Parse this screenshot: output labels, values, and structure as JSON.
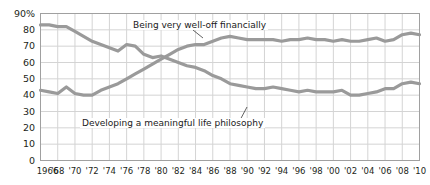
{
  "chart_data": {
    "type": "line",
    "title": "",
    "xlabel": "",
    "ylabel": "",
    "xlim": [
      1966,
      2010
    ],
    "ylim": [
      0,
      90
    ],
    "grid": true,
    "legend_position": "inline-annotations",
    "axis": {
      "y_ticks": [
        0,
        10,
        20,
        30,
        40,
        50,
        60,
        70,
        80,
        90
      ],
      "y_tick_labels": [
        "0",
        "10",
        "20",
        "30",
        "40",
        "50",
        "60",
        "70",
        "80",
        "90%"
      ],
      "x_ticks": [
        1966,
        1968,
        1970,
        1972,
        1974,
        1976,
        1978,
        1980,
        1982,
        1984,
        1986,
        1988,
        1990,
        1992,
        1994,
        1996,
        1998,
        2000,
        2002,
        2004,
        2006,
        2008,
        2010
      ],
      "x_tick_labels": [
        "1966",
        "'68",
        "'70",
        "'72",
        "'74",
        "'76",
        "'78",
        "'80",
        "'82",
        "'84",
        "'86",
        "'88",
        "'90",
        "'92",
        "'94",
        "'96",
        "'98",
        "'00",
        "'02",
        "'04",
        "'06",
        "'08",
        "'10"
      ]
    },
    "x": [
      1966,
      1967,
      1968,
      1969,
      1970,
      1971,
      1972,
      1973,
      1974,
      1975,
      1976,
      1977,
      1978,
      1979,
      1980,
      1981,
      1982,
      1983,
      1984,
      1985,
      1986,
      1987,
      1988,
      1989,
      1990,
      1991,
      1992,
      1993,
      1994,
      1995,
      1996,
      1997,
      1998,
      1999,
      2000,
      2001,
      2002,
      2003,
      2004,
      2005,
      2006,
      2007,
      2008,
      2009,
      2010
    ],
    "series": [
      {
        "name": "Developing a meaningful life philosophy",
        "color": "#9a9a9a",
        "values": [
          83,
          83,
          82,
          82,
          79,
          76,
          73,
          71,
          69,
          67,
          71,
          70,
          65,
          63,
          64,
          62,
          60,
          58,
          57,
          55,
          52,
          50,
          47,
          46,
          45,
          44,
          44,
          45,
          44,
          43,
          42,
          43,
          42,
          42,
          42,
          43,
          40,
          40,
          41,
          42,
          44,
          44,
          47,
          48,
          47
        ]
      },
      {
        "name": "Being very well-off financially",
        "color": "#9a9a9a",
        "values": [
          43,
          42,
          41,
          45,
          41,
          40,
          40,
          43,
          45,
          47,
          50,
          53,
          56,
          59,
          62,
          65,
          68,
          70,
          71,
          71,
          73,
          75,
          76,
          75,
          74,
          74,
          74,
          74,
          73,
          74,
          74,
          75,
          74,
          74,
          73,
          74,
          73,
          73,
          74,
          75,
          73,
          74,
          77,
          78,
          77
        ]
      }
    ],
    "annotations": [
      {
        "text": "Being very well-off financially",
        "target_series": "Being very well-off financially"
      },
      {
        "text": "Developing a meaningful life philosophy",
        "target_series": "Developing a meaningful life philosophy"
      }
    ]
  },
  "style": {
    "line_color": "#9a9a9a",
    "grid_color": "#d4d4d4",
    "frame_color": "#a0a0a0",
    "text_color": "#231f20",
    "background": "#ffffff"
  }
}
